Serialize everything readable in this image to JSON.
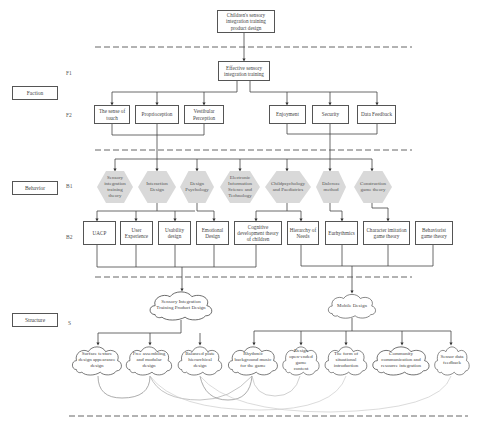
{
  "title": "Children's sensory integration training product design",
  "side_labels": {
    "faction": "Faction",
    "behavior": "Behavior",
    "structure": "Structure"
  },
  "level_labels": {
    "f1": "F1",
    "f2": "F2",
    "b1": "B1",
    "b2": "B2",
    "s": "S"
  },
  "f1": {
    "label": "Effective sensory integration training"
  },
  "f2": [
    {
      "label": "The sense of touch"
    },
    {
      "label": "Proprioception"
    },
    {
      "label": "Vestibular Perception"
    },
    {
      "label": "Enjoyment"
    },
    {
      "label": "Security"
    },
    {
      "label": "Data Feedback"
    }
  ],
  "b1": [
    {
      "label": "Sensory integration training theory"
    },
    {
      "label": "Interaction Design"
    },
    {
      "label": "Design Psychology"
    },
    {
      "label": "Electronic Information Science and Technology"
    },
    {
      "label": "Childpsychology and Paediatrics"
    },
    {
      "label": "Dalcroze method"
    },
    {
      "label": "Construction game theory"
    }
  ],
  "b2": [
    {
      "label": "UACP"
    },
    {
      "label": "User Experience"
    },
    {
      "label": "Usability design"
    },
    {
      "label": "Emotional Design"
    },
    {
      "label": "Cognitive development theory of children"
    },
    {
      "label": "Hierarchy of Needs"
    },
    {
      "label": "Eurhythmics"
    },
    {
      "label": "Character imitation game theory"
    },
    {
      "label": "Behaviorist game theory"
    }
  ],
  "s_main": [
    {
      "label": "Sensory Integration Training Product Design"
    },
    {
      "label": "Mobile Design"
    }
  ],
  "s_leaves": [
    {
      "label": "Surface texture design appearance design"
    },
    {
      "label": "Free assembling and modular design"
    },
    {
      "label": "Balanced plate hierarchical design"
    },
    {
      "label": "Rhythmic background music for the game"
    },
    {
      "label": "Design open-ended game content"
    },
    {
      "label": "The form of situational introduction"
    },
    {
      "label": "Community communication and resource integration"
    },
    {
      "label": "Sensor data feedback"
    }
  ],
  "colors": {
    "hex_fill": "#d9d9d9",
    "line": "#444444",
    "dashed": "#555555",
    "arc": "#bbbbbb"
  }
}
